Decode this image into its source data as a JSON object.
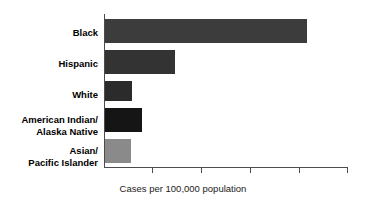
{
  "chart_data": {
    "type": "bar",
    "orientation": "horizontal",
    "title": "",
    "subtitle": "",
    "xlabel": "Cases per 100,000 population",
    "ylabel": "",
    "categories": [
      "Black",
      "Hispanic",
      "White",
      "American Indian/\nAlaska Native",
      "Asian/\nPacific Islander"
    ],
    "category_lines": [
      [
        "Black"
      ],
      [
        "Hispanic"
      ],
      [
        "White"
      ],
      [
        "American Indian/",
        "Alaska Native"
      ],
      [
        "Asian/",
        "Pacific Islander"
      ]
    ],
    "values": [
      41.5,
      14.5,
      5.5,
      7.6,
      5.3
    ],
    "xlim": [
      0,
      50
    ],
    "xticks": [
      0,
      10,
      20,
      30,
      40,
      50
    ],
    "xticklabels": [
      "",
      "",
      "",
      "",
      "",
      ""
    ],
    "grid": false,
    "legend": null,
    "bar_colors": [
      "#3c3c3c",
      "#333333",
      "#2b2b2b",
      "#151515",
      "#8a8a8a"
    ],
    "axis_color": "#4c4c4c"
  },
  "caption": {
    "x_axis_caption": "Cases per 100,000 population"
  }
}
